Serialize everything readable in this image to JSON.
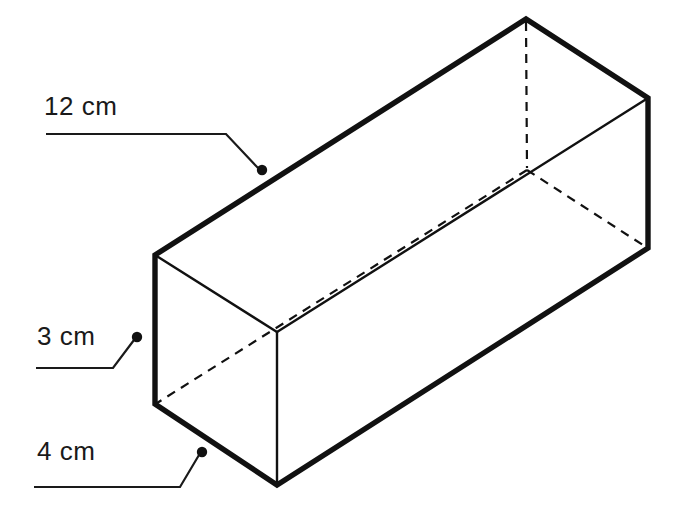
{
  "figure": {
    "kind": "rectangular-prism-isometric",
    "background_color": "#ffffff",
    "stroke_color": "#111111",
    "visible_edge_width_px": 5,
    "interior_edge_width_px": 2,
    "hidden_edge_width_px": 2,
    "hidden_edge_dash": "9 7",
    "leader_width_px": 2,
    "dot_radius_px": 5
  },
  "labels": {
    "length": {
      "text": "12 cm",
      "leader_dot": {
        "x": 262,
        "y": 170
      },
      "leader_path": "M 46,134 L 226,134 L 258,168"
    },
    "height": {
      "text": "3 cm",
      "leader_dot": {
        "x": 137,
        "y": 337
      },
      "leader_path": "M 36,368 L 113,368 L 134,340"
    },
    "depth": {
      "text": "4 cm",
      "leader_dot": {
        "x": 202,
        "y": 452
      },
      "leader_path": "M 34,487 L 180,487 L 199,455"
    }
  },
  "vertices": {
    "top_back": {
      "x": 526,
      "y": 19
    },
    "top_right": {
      "x": 648,
      "y": 98
    },
    "top_front_left": {
      "x": 155,
      "y": 255
    },
    "front_top_mid": {
      "x": 277,
      "y": 332
    },
    "bottom_left": {
      "x": 155,
      "y": 404
    },
    "front_bottom": {
      "x": 277,
      "y": 485
    },
    "bottom_right": {
      "x": 648,
      "y": 248
    },
    "hidden_back_bottom": {
      "x": 527,
      "y": 170
    }
  },
  "edges": {
    "visible_outline": "M 155,255 L 526,19 L 648,98 L 648,248 L 277,485 L 155,404 Z",
    "interior_top_left_to_mid": "M 155,255 L 277,332",
    "interior_mid_to_right": "M 277,332 L 648,98",
    "interior_vertical_front": "M 277,332 L 277,485",
    "hidden_vertical_back": "M 526,19 L 527,170",
    "hidden_back_to_left": "M 527,170 L 155,404",
    "hidden_back_to_right": "M 527,170 L 648,248"
  },
  "measurements": {
    "length_cm": 12,
    "height_cm": 3,
    "depth_cm": 4,
    "unit": "cm"
  }
}
